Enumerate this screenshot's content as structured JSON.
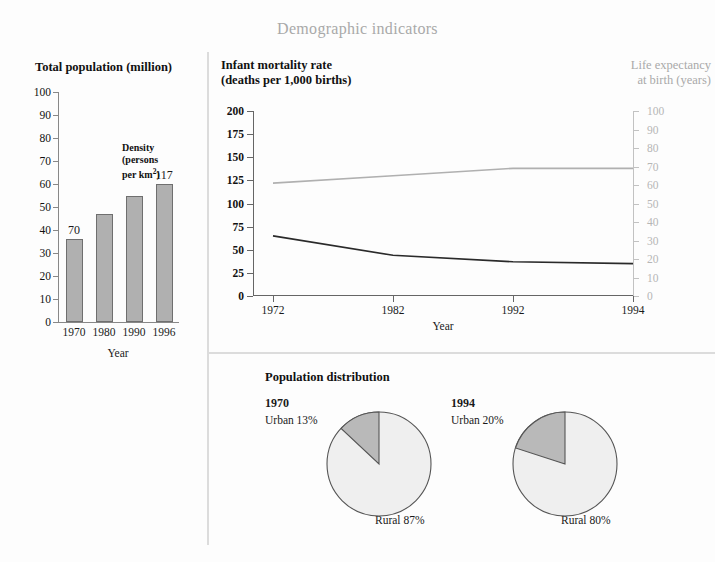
{
  "title": "Demographic indicators",
  "bar_panel": {
    "title": "Total population (million)",
    "axis_label": "Year",
    "density_note": "Density (persons per km²)",
    "value_labels": [
      "70",
      "117"
    ]
  },
  "line_panel": {
    "title_left": "Infant mortality rate (deaths per 1,000 births)",
    "title_left_line1": "Infant mortality rate",
    "title_left_line2": "(deaths per 1,000 births)",
    "title_right_line1": "Life expectancy",
    "title_right_line2": "at birth (years)",
    "axis_label": "Year"
  },
  "pie_panel": {
    "heading": "Population distribution"
  },
  "colors": {
    "title_gray": "#a9a9a9",
    "bar_fill": "#b0b0b0",
    "bar_stroke": "#6f6f6f",
    "imr_line": "#2a2a2a",
    "life_line": "#b0b0b0",
    "pie_urban": "#b9b9b9",
    "pie_rural": "#efefef",
    "pie_stroke": "#555555",
    "divider": "#dcdcdc"
  },
  "chart_data": [
    {
      "type": "bar",
      "title": "Total population (million)",
      "xlabel": "Year",
      "ylabel": "",
      "categories": [
        "1970",
        "1980",
        "1990",
        "1996"
      ],
      "values": [
        36,
        47,
        55,
        60
      ],
      "ylim": [
        0,
        100
      ],
      "yticks": [
        0,
        10,
        20,
        30,
        40,
        50,
        60,
        70,
        80,
        90,
        100
      ],
      "grid": false,
      "annotations": [
        {
          "text": "70",
          "category": "1970",
          "note": "density persons per km2"
        },
        {
          "text": "117",
          "category": "1996",
          "note": "density persons per km2"
        },
        {
          "text": "Density (persons per km²)",
          "note": "annotation for value labels"
        }
      ]
    },
    {
      "type": "line",
      "title": "Infant mortality rate (deaths per 1,000 births)",
      "xlabel": "Year",
      "ylabel": "Infant mortality rate (deaths per 1,000 births)",
      "y2label": "Life expectancy at birth (years)",
      "x": [
        "1972",
        "1982",
        "1992",
        "1994"
      ],
      "ylim": [
        0,
        200
      ],
      "yticks": [
        0,
        25,
        50,
        75,
        100,
        125,
        150,
        175,
        200
      ],
      "y2lim": [
        0,
        100
      ],
      "y2ticks": [
        0,
        10,
        20,
        30,
        40,
        50,
        60,
        70,
        80,
        90,
        100
      ],
      "grid": false,
      "legend": "none",
      "series": [
        {
          "name": "Infant mortality rate (deaths per 1,000 births)",
          "axis": "left",
          "values": [
            65,
            44,
            37,
            35
          ]
        },
        {
          "name": "Life expectancy at birth (years)",
          "axis": "right",
          "values": [
            61,
            65,
            69,
            69
          ]
        }
      ]
    },
    {
      "type": "pie",
      "title": "Population distribution",
      "year": "1970",
      "labels": [
        "Urban",
        "Rural"
      ],
      "values": [
        13,
        87
      ],
      "value_labels": [
        "Urban 13%",
        "Rural 87%"
      ]
    },
    {
      "type": "pie",
      "title": "Population distribution",
      "year": "1994",
      "labels": [
        "Urban",
        "Rural"
      ],
      "values": [
        20,
        80
      ],
      "value_labels": [
        "Urban 20%",
        "Rural 80%"
      ]
    }
  ]
}
